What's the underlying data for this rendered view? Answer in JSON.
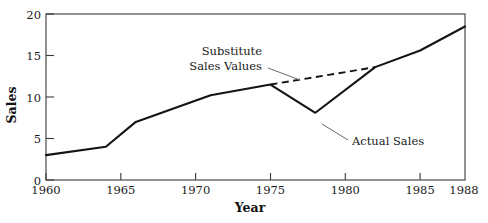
{
  "chart_data": {
    "type": "line",
    "title": "",
    "xlabel": "Year",
    "ylabel": "Sales",
    "xlim": [
      1960,
      1988
    ],
    "ylim": [
      0,
      20
    ],
    "grid": false,
    "legend": "none",
    "xticks": [
      1960,
      1965,
      1970,
      1975,
      1980,
      1985,
      1988
    ],
    "xticklabels": [
      "1960",
      "1965",
      "1970",
      "1975",
      "1980",
      "1985",
      "1988"
    ],
    "yticks": [
      0,
      5,
      10,
      15,
      20
    ],
    "yticklabels": [
      "0",
      "5",
      "10",
      "15",
      "20"
    ],
    "series": [
      {
        "name": "Actual Sales",
        "style": "solid",
        "x": [
          1960,
          1964,
          1966,
          1971,
          1975,
          1978,
          1982,
          1985,
          1988
        ],
        "values": [
          3.0,
          4.0,
          7.0,
          10.2,
          11.5,
          8.1,
          13.6,
          15.6,
          18.5
        ]
      },
      {
        "name": "Substitute Sales Values",
        "style": "dashed",
        "x": [
          1975,
          1982
        ],
        "values": [
          11.5,
          13.6
        ]
      }
    ],
    "annotations": [
      {
        "id": "substitute",
        "line1": "Substitute",
        "line2": "Sales Values",
        "text": "Substitute Sales Values"
      },
      {
        "id": "actual",
        "text": "Actual Sales"
      }
    ],
    "colors": {
      "line": "#141414",
      "frame": "#4a4a4a",
      "leader": "#6a6a6a",
      "background": "#ffffff"
    }
  }
}
